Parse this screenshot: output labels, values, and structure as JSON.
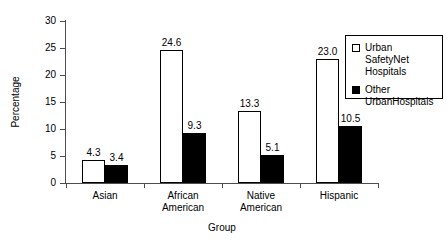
{
  "chart_data": {
    "type": "bar",
    "title": "",
    "xlabel": "Group",
    "ylabel": "Percentage",
    "ylim": [
      0,
      30
    ],
    "yticks": [
      "0",
      "5",
      "10",
      "15",
      "20",
      "25",
      "30"
    ],
    "grid": false,
    "legend_position": "top-right",
    "categories": [
      "Asian",
      "African American",
      "Native American",
      "Hispanic"
    ],
    "category_lines": [
      [
        "Asian"
      ],
      [
        "African",
        "American"
      ],
      [
        "Native",
        "American"
      ],
      [
        "Hispanic"
      ]
    ],
    "series": [
      {
        "name": "Urban Safety Net Hospitals",
        "style": "open",
        "values": [
          4.3,
          24.6,
          13.3,
          23.0
        ],
        "labels": [
          "4.3",
          "24.6",
          "13.3",
          "23.0"
        ]
      },
      {
        "name": "Other Urban Hospitals",
        "style": "filled",
        "values": [
          3.4,
          9.3,
          5.1,
          10.5
        ],
        "labels": [
          "3.4",
          "9.3",
          "5.1",
          "10.5"
        ]
      }
    ]
  },
  "legend": {
    "entries": [
      {
        "label_line1": "Urban Safety",
        "label_line2": "Net Hospitals",
        "swatch": "open"
      },
      {
        "label_line1": "Other Urban",
        "label_line2": "Hospitals",
        "swatch": "filled"
      }
    ]
  },
  "colors": {
    "series_open_fill": "#ffffff",
    "series_filled_fill": "#000000",
    "outline": "#000000",
    "axis": "#4d4d4d",
    "background": "#ffffff"
  }
}
